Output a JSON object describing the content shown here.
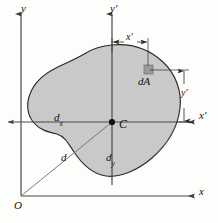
{
  "figure": {
    "background_color": "#fdfdfc",
    "area_fill_color": "#c9c9c9",
    "area_stroke_color": "#2b2b2b",
    "axis_color": "#4a4a4a",
    "dim_color": "#2b2b2b",
    "element_fill_color": "#9a9a9a"
  },
  "axes": {
    "y_label": "y",
    "y_prime_label": "y′",
    "x_label": "x",
    "x_prime_label": "x′",
    "origin_label": "O",
    "centroid_label": "C"
  },
  "dimensions": {
    "dx_label": "d",
    "dx_sub": "x",
    "dy_label": "d",
    "dy_sub": "y",
    "d_label": "d",
    "x_prime_dim_label": "x′",
    "y_prime_dim_label": "y′"
  },
  "element": {
    "dA_label": "dA"
  },
  "geometry": {
    "origin": {
      "x": 21,
      "y": 196
    },
    "centroid": {
      "x": 112,
      "y": 122
    },
    "dA_square": {
      "x": 144,
      "y": 65,
      "w": 9,
      "h": 9
    },
    "y_axis_x": 21,
    "y_prime_axis_x": 112,
    "x_axis_y": 196,
    "x_prime_axis_y": 122
  }
}
